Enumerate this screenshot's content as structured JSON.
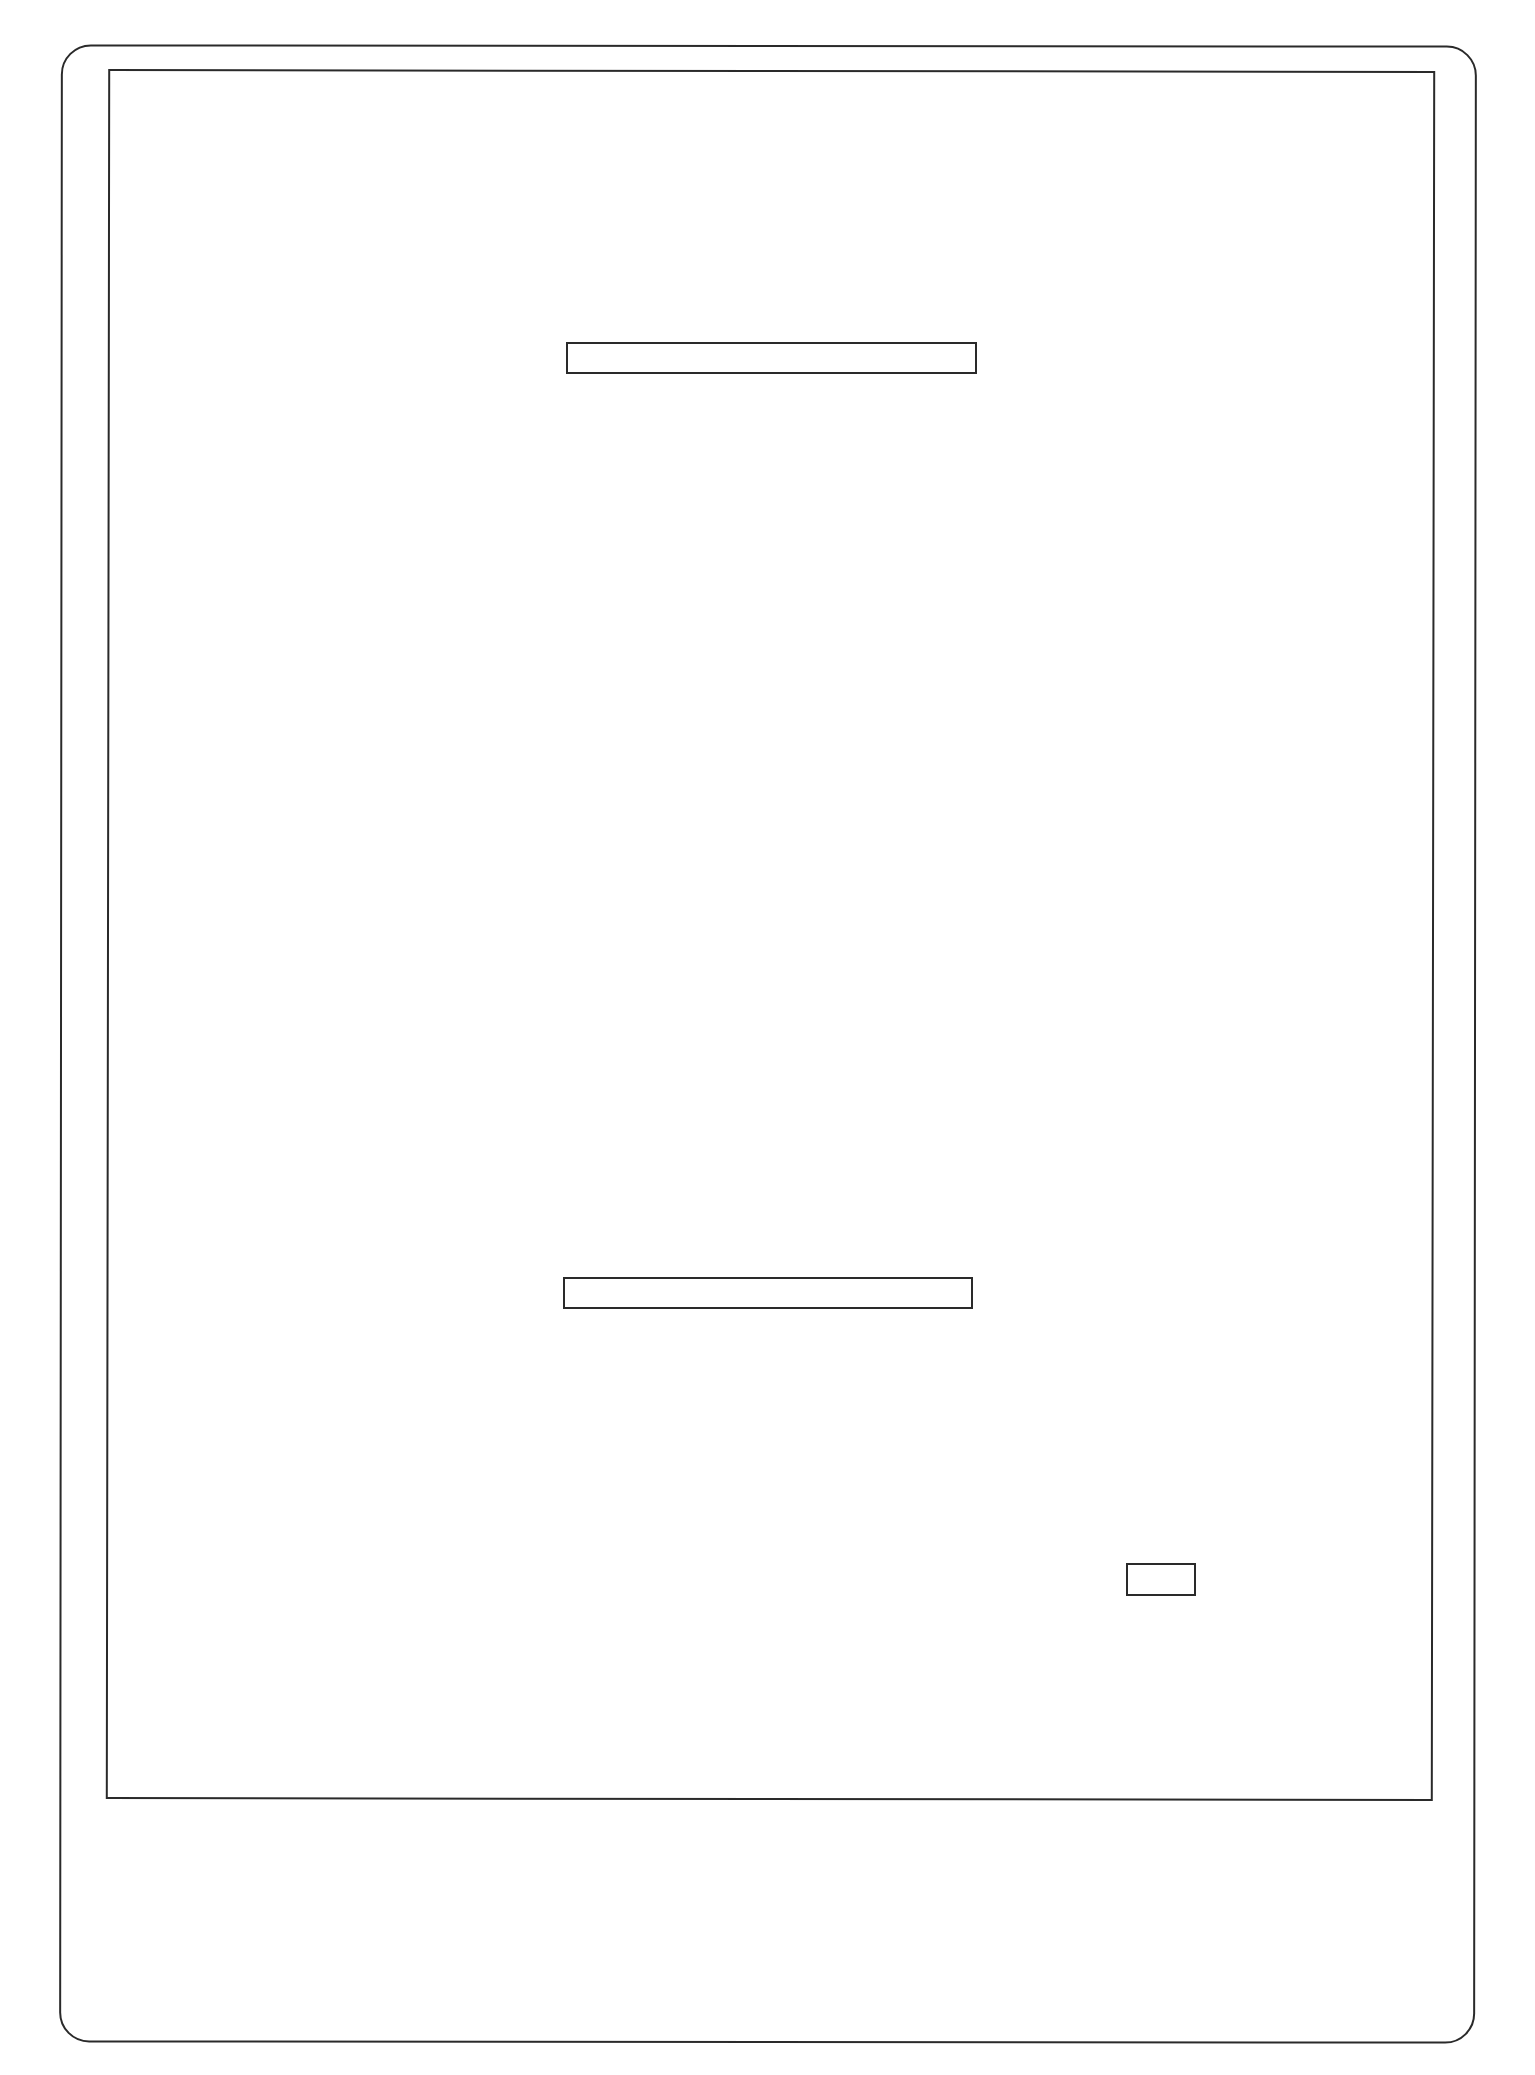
{
  "wireframe": {
    "type": "tablet-sketch",
    "stroke_color": "#2a2a2a",
    "background_color": "#ffffff",
    "device_frame": {
      "shape": "rounded-rectangle"
    },
    "screen": {
      "shape": "rectangle"
    },
    "elements": [
      {
        "id": "top-bar",
        "kind": "text-field-placeholder",
        "text": ""
      },
      {
        "id": "bottom-bar",
        "kind": "text-field-placeholder",
        "text": ""
      },
      {
        "id": "small-box",
        "kind": "button-placeholder",
        "text": ""
      }
    ]
  }
}
